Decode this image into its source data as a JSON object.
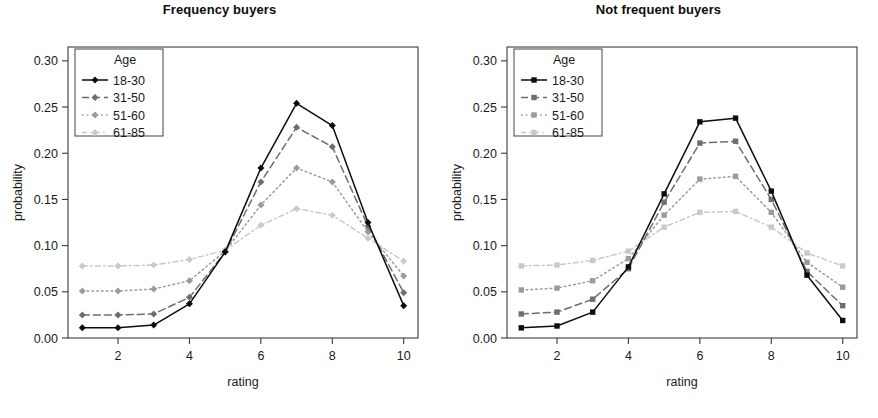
{
  "figure": {
    "cropped_top_text": "",
    "background": "#ffffff"
  },
  "panels": [
    {
      "id": "frequency-buyers",
      "title": "Frequency buyers",
      "xlabel": "rating",
      "ylabel": "probability"
    },
    {
      "id": "not-frequent-buyers",
      "title": "Not frequent buyers",
      "xlabel": "rating",
      "ylabel": "probability"
    }
  ],
  "legend": {
    "title": "Age",
    "position": "top-left",
    "items": [
      {
        "label": "18-30",
        "color": "#0d0d0d",
        "dash": "none",
        "marker_left": "diamond",
        "marker_right": "square"
      },
      {
        "label": "31-50",
        "color": "#6e6e6e",
        "dash": "dashed",
        "marker_left": "diamond",
        "marker_right": "square"
      },
      {
        "label": "51-60",
        "color": "#9b9b9b",
        "dash": "dotted",
        "marker_left": "diamond",
        "marker_right": "square"
      },
      {
        "label": "61-85",
        "color": "#c9c9c9",
        "dash": "dashdot",
        "marker_left": "diamond",
        "marker_right": "square"
      }
    ]
  },
  "axes": {
    "y_ticks": [
      "0.00",
      "0.05",
      "0.10",
      "0.15",
      "0.20",
      "0.25",
      "0.30"
    ],
    "y_tick_values": [
      0.0,
      0.05,
      0.1,
      0.15,
      0.2,
      0.25,
      0.3
    ],
    "ylim": [
      0.0,
      0.315
    ],
    "x_ticks": [
      "2",
      "4",
      "6",
      "8",
      "10"
    ],
    "x_tick_values": [
      2,
      4,
      6,
      8,
      10
    ],
    "xlim": [
      0.6,
      10.4
    ],
    "grid": false
  },
  "chart_data": [
    {
      "type": "line",
      "title": "Frequency buyers",
      "xlabel": "rating",
      "ylabel": "probability",
      "x": [
        1,
        2,
        3,
        4,
        5,
        6,
        7,
        8,
        9,
        10
      ],
      "xlim": [
        0.6,
        10.4
      ],
      "ylim": [
        0.0,
        0.315
      ],
      "legend_title": "Age",
      "legend_position": "top-left",
      "grid": false,
      "marker": "diamond",
      "series": [
        {
          "name": "18-30",
          "color": "#0d0d0d",
          "dash": "none",
          "values": [
            0.011,
            0.011,
            0.014,
            0.037,
            0.093,
            0.184,
            0.254,
            0.23,
            0.125,
            0.035
          ]
        },
        {
          "name": "31-50",
          "color": "#6e6e6e",
          "dash": "dashed",
          "values": [
            0.025,
            0.025,
            0.026,
            0.044,
            0.093,
            0.169,
            0.228,
            0.207,
            0.121,
            0.049
          ]
        },
        {
          "name": "51-60",
          "color": "#9b9b9b",
          "dash": "dotted",
          "values": [
            0.051,
            0.051,
            0.053,
            0.062,
            0.094,
            0.144,
            0.184,
            0.169,
            0.115,
            0.067
          ]
        },
        {
          "name": "61-85",
          "color": "#c9c9c9",
          "dash": "dashdot",
          "values": [
            0.078,
            0.078,
            0.079,
            0.085,
            0.095,
            0.122,
            0.14,
            0.133,
            0.108,
            0.083
          ]
        }
      ]
    },
    {
      "type": "line",
      "title": "Not frequent buyers",
      "xlabel": "rating",
      "ylabel": "probability",
      "x": [
        1,
        2,
        3,
        4,
        5,
        6,
        7,
        8,
        9,
        10
      ],
      "xlim": [
        0.6,
        10.4
      ],
      "ylim": [
        0.0,
        0.315
      ],
      "legend_title": "Age",
      "legend_position": "top-left",
      "grid": false,
      "marker": "square",
      "series": [
        {
          "name": "18-30",
          "color": "#0d0d0d",
          "dash": "none",
          "values": [
            0.011,
            0.013,
            0.028,
            0.077,
            0.156,
            0.234,
            0.238,
            0.159,
            0.068,
            0.019
          ]
        },
        {
          "name": "31-50",
          "color": "#6e6e6e",
          "dash": "dashed",
          "values": [
            0.026,
            0.028,
            0.042,
            0.075,
            0.147,
            0.211,
            0.213,
            0.15,
            0.072,
            0.035
          ]
        },
        {
          "name": "51-60",
          "color": "#9b9b9b",
          "dash": "dotted",
          "values": [
            0.052,
            0.054,
            0.062,
            0.086,
            0.133,
            0.172,
            0.175,
            0.136,
            0.082,
            0.055
          ]
        },
        {
          "name": "61-85",
          "color": "#c9c9c9",
          "dash": "dashdot",
          "values": [
            0.078,
            0.079,
            0.084,
            0.094,
            0.12,
            0.136,
            0.137,
            0.12,
            0.092,
            0.078
          ]
        }
      ]
    }
  ]
}
